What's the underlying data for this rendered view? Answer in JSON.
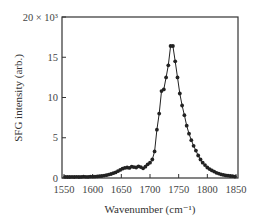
{
  "chart_data": {
    "type": "line",
    "title": "",
    "xlabel": "Wavenumber (cm⁻¹)",
    "ylabel": "SFG intensity (arb.)",
    "xlim": [
      1550,
      1850
    ],
    "ylim": [
      0,
      20000
    ],
    "y_top_label": "20 × 10³",
    "x_ticks": [
      1550,
      1600,
      1650,
      1700,
      1750,
      1800,
      1850
    ],
    "y_ticks": [
      0,
      5,
      10,
      15,
      20
    ],
    "y_tick_labels": [
      "0",
      "5",
      "10",
      "15",
      "20 × 10³"
    ],
    "grid": false,
    "legend": null,
    "marker": "filled-circle",
    "series": [
      {
        "name": "SFG spectrum",
        "color": "#222222",
        "x": [
          1552,
          1556,
          1560,
          1564,
          1568,
          1572,
          1576,
          1580,
          1584,
          1588,
          1592,
          1596,
          1600,
          1604,
          1608,
          1612,
          1616,
          1620,
          1624,
          1628,
          1632,
          1636,
          1640,
          1644,
          1648,
          1652,
          1656,
          1660,
          1664,
          1668,
          1672,
          1676,
          1680,
          1684,
          1688,
          1692,
          1696,
          1700,
          1704,
          1708,
          1712,
          1716,
          1720,
          1724,
          1728,
          1732,
          1736,
          1740,
          1744,
          1748,
          1752,
          1756,
          1760,
          1764,
          1768,
          1772,
          1776,
          1780,
          1784,
          1788,
          1792,
          1796,
          1800,
          1804,
          1808,
          1812,
          1816,
          1820,
          1824,
          1828,
          1832,
          1836,
          1840,
          1844,
          1848
        ],
        "y": [
          150,
          120,
          130,
          140,
          120,
          150,
          130,
          140,
          160,
          150,
          140,
          170,
          160,
          180,
          200,
          220,
          250,
          300,
          350,
          420,
          500,
          600,
          700,
          850,
          1000,
          1150,
          1250,
          1300,
          1250,
          1400,
          1350,
          1300,
          1450,
          1350,
          1200,
          1400,
          1700,
          1900,
          2300,
          3300,
          6000,
          8000,
          10800,
          11000,
          12500,
          14000,
          16400,
          16400,
          14500,
          12500,
          10500,
          9000,
          7800,
          6500,
          5500,
          4700,
          4000,
          3400,
          2800,
          2300,
          1900,
          1600,
          1300,
          1100,
          950,
          800,
          650,
          550,
          450,
          380,
          320,
          280,
          250,
          220,
          180
        ]
      }
    ]
  }
}
